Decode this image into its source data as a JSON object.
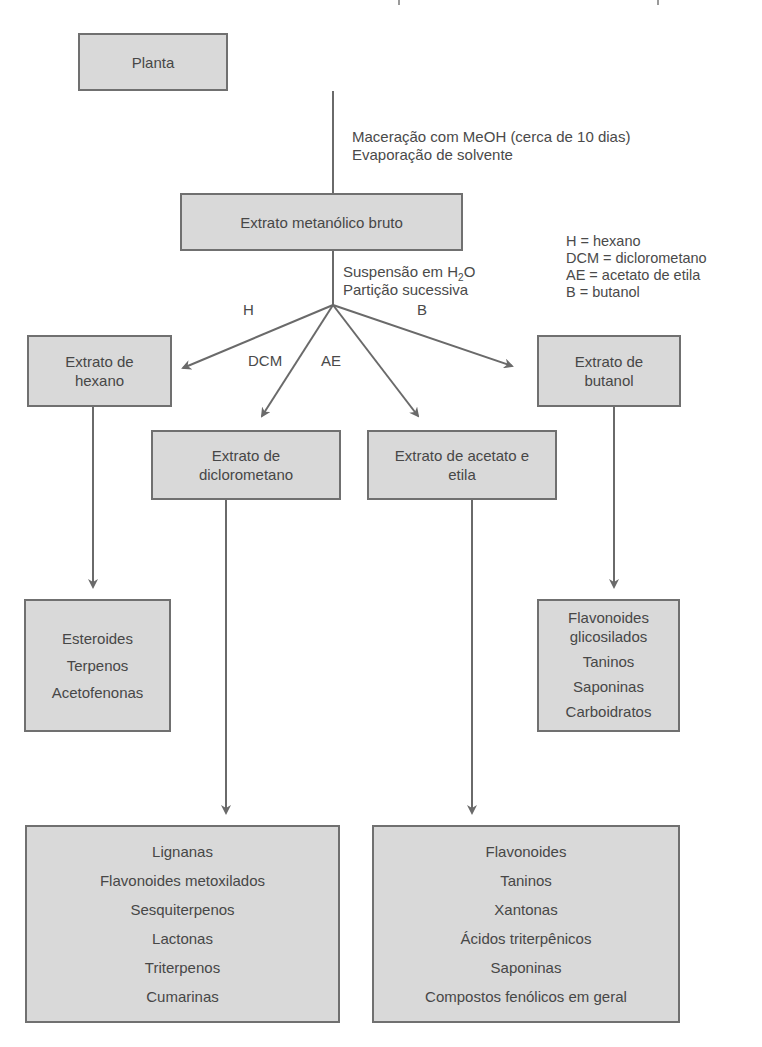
{
  "diagram": {
    "title": "",
    "nodes": {
      "planta": {
        "label": "Planta"
      },
      "extrato_bruto": {
        "label": "Extrato metanólico bruto"
      },
      "extrato_hexano": {
        "lines": [
          "Extrato de",
          "hexano"
        ]
      },
      "extrato_butanol": {
        "lines": [
          "Extrato de",
          "butanol"
        ]
      },
      "extrato_dcm": {
        "lines": [
          "Extrato de",
          "diclorometano"
        ]
      },
      "extrato_ae": {
        "lines": [
          "Extrato de acetato e",
          "etila"
        ]
      },
      "compostos_hexano": {
        "items": [
          "Esteroides",
          "Terpenos",
          "Acetofenonas"
        ]
      },
      "compostos_butanol": {
        "items": [
          "Flavonoides",
          "glicosilados",
          "Taninos",
          "Saponinas",
          "Carboidratos"
        ]
      },
      "compostos_dcm": {
        "items": [
          "Lignanas",
          "Flavonoides metoxilados",
          "Sesquiterpenos",
          "Lactonas",
          "Triterpenos",
          "Cumarinas"
        ]
      },
      "compostos_ae": {
        "items": [
          "Flavonoides",
          "Taninos",
          "Xantonas",
          "Ácidos triterpênicos",
          "Saponinas",
          "Compostos fenólicos em geral"
        ]
      }
    },
    "step_notes": {
      "maceracao": [
        "Maceração com MeOH (cerca de 10 dias)",
        "Evaporação de solvente"
      ],
      "suspensao_line1_prefix": "Suspensão em H",
      "suspensao_sub": "2",
      "suspensao_line1_suffix": "O",
      "suspensao_line2": "Partição sucessiva"
    },
    "edge_labels": {
      "h": "H",
      "dcm": "DCM",
      "ae": "AE",
      "b": "B"
    },
    "legend": [
      "H = hexano",
      "DCM = diclorometano",
      "AE = acetato de etila",
      "B = butanol"
    ],
    "colors": {
      "box_fill": "#d9d9d9",
      "box_border": "#707070",
      "line": "#6a6a6a",
      "text": "#474747"
    }
  }
}
